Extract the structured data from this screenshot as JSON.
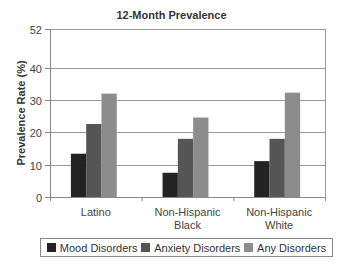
{
  "chart_data": {
    "type": "bar",
    "title": "12-Month Prevalence",
    "xlabel": "",
    "ylabel": "Prevalence Rate (%)",
    "ylim": [
      0,
      52
    ],
    "yticks": [
      0,
      10,
      20,
      30,
      40,
      52
    ],
    "grid": true,
    "legend_position": "bottom",
    "categories": [
      [
        "Latino"
      ],
      [
        "Non-Hispanic",
        "Black"
      ],
      [
        "Non-Hispanic",
        "White"
      ]
    ],
    "series": [
      {
        "name": "Mood Disorders",
        "color": "#232323",
        "values": [
          13.4,
          7.5,
          11.1
        ]
      },
      {
        "name": "Anxiety Disorders",
        "color": "#555555",
        "values": [
          22.6,
          18.0,
          18.0
        ]
      },
      {
        "name": "Any Disorders",
        "color": "#8c8c8c",
        "values": [
          32.0,
          24.6,
          32.3
        ]
      }
    ]
  }
}
